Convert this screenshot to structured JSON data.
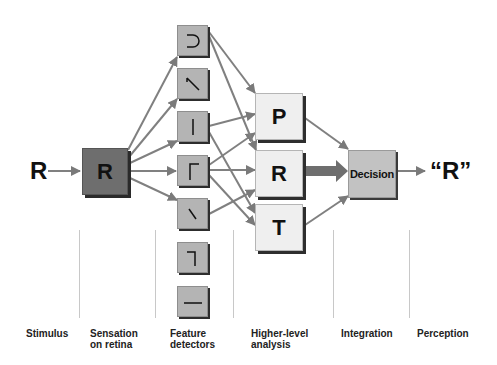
{
  "diagram": {
    "stimulus_letter": "R",
    "retina_letter": "R",
    "feature_detectors": [
      {
        "glyph": "curve-right-icon"
      },
      {
        "glyph": "diagonal-down-icon"
      },
      {
        "glyph": "vertical-line-icon"
      },
      {
        "glyph": "corner-top-left-icon"
      },
      {
        "glyph": "backslash-icon"
      },
      {
        "glyph": "corner-top-right-icon"
      },
      {
        "glyph": "horizontal-line-icon"
      }
    ],
    "higher_level": [
      "P",
      "R",
      "T"
    ],
    "decision_label": "Decision",
    "perception_output": "“R”",
    "stages": [
      {
        "line1": "Stimulus",
        "line2": ""
      },
      {
        "line1": "Sensation",
        "line2": "on retina"
      },
      {
        "line1": "Feature",
        "line2": "detectors"
      },
      {
        "line1": "Higher-level",
        "line2": "analysis"
      },
      {
        "line1": "Integration",
        "line2": ""
      },
      {
        "line1": "Perception",
        "line2": ""
      }
    ],
    "colors": {
      "retina_box": "#6e6e6e",
      "feature_box": "#b4b4b4",
      "letter_box": "#efefef",
      "decision_box": "#c2c2c2",
      "arrow": "#7a7a7a"
    }
  }
}
